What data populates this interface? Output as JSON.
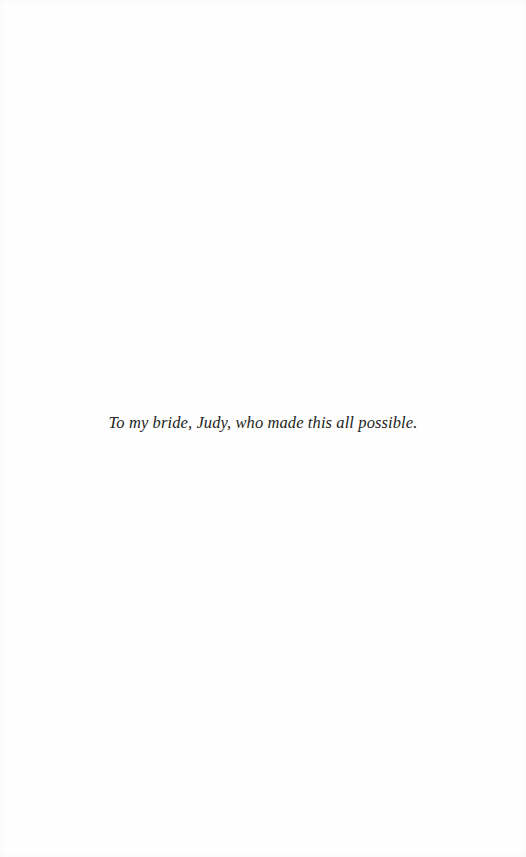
{
  "page": {
    "type": "dedication",
    "dedication_text": "To my bride, Judy, who made this all possible."
  }
}
